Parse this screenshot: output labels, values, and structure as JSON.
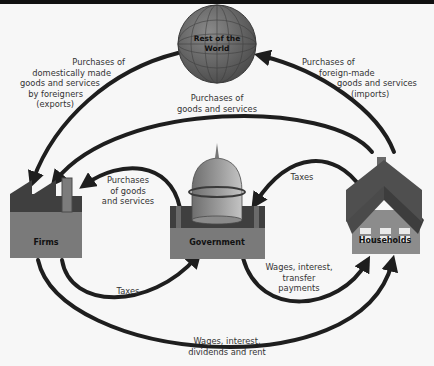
{
  "diagram": {
    "colors": {
      "background": "#f7f7f7",
      "arrow": "#1e1e1e",
      "node_dark": "#3d3d3d",
      "node_mid": "#6a6a6a",
      "node_light": "#8f8f8f",
      "top_bar": "#111111"
    },
    "nodes": {
      "rest_of_world": {
        "label_line1": "Rest of the",
        "label_line2": "World",
        "icon": "globe-icon"
      },
      "firms": {
        "label": "Firms",
        "icon": "factory-icon"
      },
      "government": {
        "label": "Government",
        "icon": "capitol-dome-icon"
      },
      "households": {
        "label": "Households",
        "icon": "house-icon"
      }
    },
    "flows": {
      "exports": {
        "from": "Rest of the World",
        "to": "Firms",
        "lines": [
          "Purchases of",
          "domestically made",
          "goods and services",
          "by foreigners",
          "(exports)"
        ]
      },
      "imports": {
        "from": "Households",
        "to": "Rest of the World",
        "lines": [
          "Purchases of",
          "foreign-made",
          "goods and services",
          "(imports)"
        ]
      },
      "household_purchases": {
        "from": "Households",
        "to": "Firms",
        "lines": [
          "Purchases of",
          "goods and services"
        ]
      },
      "government_purchases": {
        "from": "Government",
        "to": "Firms",
        "lines": [
          "Purchases",
          "of goods",
          "and services"
        ]
      },
      "household_taxes": {
        "from": "Households",
        "to": "Government",
        "lines": [
          "Taxes"
        ]
      },
      "firm_taxes": {
        "from": "Firms",
        "to": "Government",
        "lines": [
          "Taxes"
        ]
      },
      "transfers": {
        "from": "Government",
        "to": "Households",
        "lines": [
          "Wages, interest,",
          "transfer",
          "payments"
        ]
      },
      "factor_payments": {
        "from": "Firms",
        "to": "Households",
        "lines": [
          "Wages, interest,",
          "dividends and rent"
        ]
      }
    }
  }
}
